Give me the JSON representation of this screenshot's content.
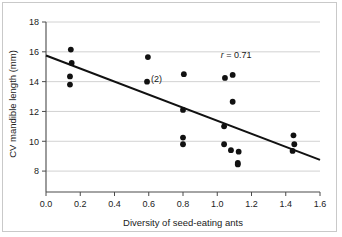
{
  "chart_data": {
    "type": "scatter",
    "title": "",
    "xlabel": "Diversity of seed-eating ants",
    "ylabel": "CV mandible length (mm)",
    "xlim": [
      0.0,
      1.6
    ],
    "ylim": [
      7.0,
      18.0
    ],
    "xticks": [
      "0.0",
      "0.2",
      "0.4",
      "0.6",
      "0.8",
      "1.0",
      "1.2",
      "1.4",
      "1.6"
    ],
    "xtick_values": [
      0.0,
      0.2,
      0.4,
      0.6,
      0.8,
      1.0,
      1.2,
      1.4,
      1.6
    ],
    "yticks": [
      "8",
      "10",
      "12",
      "14",
      "16",
      "18"
    ],
    "ytick_values": [
      8,
      10,
      12,
      14,
      16,
      18
    ],
    "grid": "horizontal",
    "legend": "none",
    "marker_color": "#111111",
    "gridline_color": "#c6c6c6",
    "axis_color": "#4a4a4a",
    "points": [
      {
        "x": 0.145,
        "y": 16.15
      },
      {
        "x": 0.15,
        "y": 15.25
      },
      {
        "x": 0.14,
        "y": 14.35
      },
      {
        "x": 0.14,
        "y": 13.8
      },
      {
        "x": 0.595,
        "y": 15.65
      },
      {
        "x": 0.59,
        "y": 14.0,
        "label": "(2)"
      },
      {
        "x": 0.805,
        "y": 14.5
      },
      {
        "x": 0.8,
        "y": 12.1
      },
      {
        "x": 0.8,
        "y": 10.25
      },
      {
        "x": 0.8,
        "y": 9.8
      },
      {
        "x": 1.045,
        "y": 14.25
      },
      {
        "x": 1.09,
        "y": 14.45
      },
      {
        "x": 1.09,
        "y": 12.65
      },
      {
        "x": 1.04,
        "y": 11.0
      },
      {
        "x": 1.04,
        "y": 9.8
      },
      {
        "x": 1.08,
        "y": 9.4
      },
      {
        "x": 1.125,
        "y": 9.3
      },
      {
        "x": 1.12,
        "y": 8.55
      },
      {
        "x": 1.12,
        "y": 8.45
      },
      {
        "x": 1.445,
        "y": 10.4
      },
      {
        "x": 1.45,
        "y": 9.8
      },
      {
        "x": 1.44,
        "y": 9.35
      }
    ],
    "fit_line": {
      "x0": 0.0,
      "y0": 15.75,
      "x1": 1.6,
      "y1": 8.75
    },
    "annotations": [
      {
        "id": "correlation",
        "prefix": "r",
        "text": " = 0.71",
        "x": 1.02,
        "y": 15.6
      },
      {
        "id": "duplicate-count",
        "text": "(2)",
        "x": 0.645,
        "y": 13.95
      }
    ]
  }
}
